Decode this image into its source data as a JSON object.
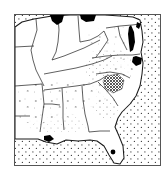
{
  "figure": {
    "type": "distribution-map",
    "region_title": "Southeastern United States",
    "projection_note": "outline map with state boundaries",
    "background_color": "#ffffff",
    "line_color": "#1a1a1a",
    "water_fill_color": "#000000",
    "ocean_stipple_color": "#3a3a3a",
    "dense_hatch_color": "#4a4a4a",
    "frame": {
      "visible": true,
      "color": "#555555",
      "x": 14,
      "y": 14,
      "width": 147,
      "height": 152
    }
  },
  "legend_items": [
    {
      "key": "ocean",
      "label": "ocean / water body stipple",
      "pattern": "regular-dot-grid"
    },
    {
      "key": "coastal-plain",
      "label": "coastal plain sparse stipple",
      "pattern": "sparse-dot-grid"
    },
    {
      "key": "core-range",
      "label": "core range dense crosshatch",
      "pattern": "dense-crosshatch"
    },
    {
      "key": "scattered",
      "label": "scattered occurrence marks",
      "pattern": "scattered-ticks"
    },
    {
      "key": "lakes",
      "label": "lakes and bays",
      "pattern": "solid-black"
    }
  ],
  "features": {
    "great_lakes": [
      "Lake Michigan southern tip",
      "Lake Erie southern shore"
    ],
    "bays": [
      "Chesapeake Bay",
      "Delaware Bay",
      "Pamlico Sound"
    ],
    "inland_lake": "Lake Okeechobee",
    "peninsula": "Florida"
  },
  "map_extent": {
    "north_label": "Great Lakes",
    "south_label": "Florida Keys",
    "west_label": "Mississippi Valley",
    "east_label": "Atlantic Ocean"
  }
}
